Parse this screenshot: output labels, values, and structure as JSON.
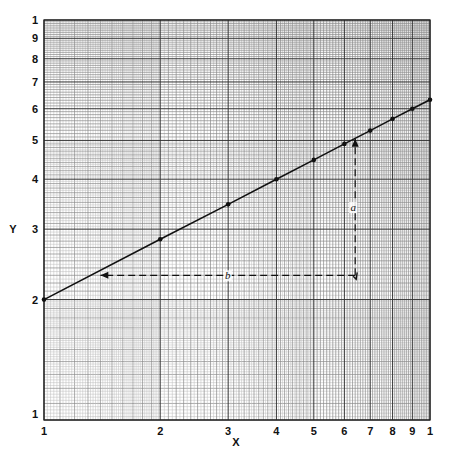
{
  "chart_data": {
    "type": "line",
    "title": "",
    "xlabel": "X",
    "ylabel": "Y",
    "xscale": "log",
    "yscale": "log",
    "xlim": [
      1,
      10
    ],
    "ylim": [
      1,
      10
    ],
    "grid": true,
    "x_tick_labels": [
      "1",
      "2",
      "3",
      "4",
      "5",
      "6",
      "7",
      "8",
      "9",
      "1"
    ],
    "x_tick_values": [
      1,
      2,
      3,
      4,
      5,
      6,
      7,
      8,
      9,
      10
    ],
    "y_tick_labels": [
      "1",
      "2",
      "3",
      "4",
      "5",
      "6",
      "7",
      "8",
      "9",
      "1"
    ],
    "y_tick_values": [
      1,
      2,
      3,
      4,
      5,
      6,
      7,
      8,
      9,
      10
    ],
    "series": [
      {
        "name": "Y = 2·X^0.5",
        "x": [
          1,
          2,
          3,
          4,
          5,
          6,
          7,
          8,
          9,
          10
        ],
        "y": [
          2.0,
          2.83,
          3.46,
          4.0,
          4.47,
          4.9,
          5.29,
          5.66,
          6.0,
          6.32
        ]
      }
    ],
    "annotations": [
      {
        "label": "b",
        "type": "horizontal-dashed-arrow",
        "from": [
          6.4,
          2.3
        ],
        "to": [
          1.4,
          2.3
        ]
      },
      {
        "label": "a",
        "type": "vertical-dashed-arrow",
        "from": [
          6.4,
          2.3
        ],
        "to": [
          6.4,
          5.05
        ]
      }
    ]
  }
}
